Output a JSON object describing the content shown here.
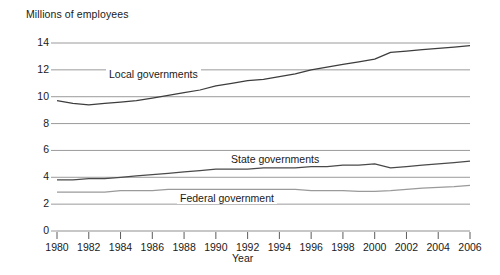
{
  "chart_data": {
    "type": "line",
    "title": "",
    "ylabel": "Millions of employees",
    "xlabel": "Year",
    "xlim": [
      1980,
      2006
    ],
    "ylim": [
      0,
      14
    ],
    "yticks": [
      0,
      2,
      4,
      6,
      8,
      10,
      12,
      14
    ],
    "xticks": [
      1980,
      1982,
      1984,
      1986,
      1988,
      1990,
      1992,
      1994,
      1996,
      1998,
      2000,
      2002,
      2004,
      2006
    ],
    "grid": true,
    "legend_position": "inline-labels",
    "x": [
      1980,
      1981,
      1982,
      1983,
      1984,
      1985,
      1986,
      1987,
      1988,
      1989,
      1990,
      1991,
      1992,
      1993,
      1994,
      1995,
      1996,
      1997,
      1998,
      1999,
      2000,
      2001,
      2002,
      2003,
      2004,
      2005,
      2006
    ],
    "series": [
      {
        "name": "Local governments",
        "color": "#3d3d3d",
        "values": [
          9.7,
          9.5,
          9.4,
          9.5,
          9.6,
          9.7,
          9.9,
          10.1,
          10.3,
          10.5,
          10.8,
          11.0,
          11.2,
          11.3,
          11.5,
          11.7,
          12.0,
          12.2,
          12.4,
          12.6,
          12.8,
          13.3,
          13.4,
          13.5,
          13.6,
          13.7,
          13.8
        ]
      },
      {
        "name": "State governments",
        "color": "#4a4a4a",
        "values": [
          3.8,
          3.8,
          3.9,
          3.9,
          4.0,
          4.1,
          4.2,
          4.3,
          4.4,
          4.5,
          4.6,
          4.6,
          4.6,
          4.7,
          4.7,
          4.7,
          4.8,
          4.8,
          4.9,
          4.9,
          5.0,
          4.7,
          4.8,
          4.9,
          5.0,
          5.1,
          5.2
        ]
      },
      {
        "name": "Federal government",
        "color": "#9a9a9a",
        "values": [
          2.9,
          2.9,
          2.9,
          2.9,
          3.0,
          3.0,
          3.0,
          3.1,
          3.1,
          3.1,
          3.1,
          3.1,
          3.1,
          3.1,
          3.1,
          3.1,
          3.0,
          3.0,
          3.0,
          2.95,
          2.95,
          3.0,
          3.1,
          3.2,
          3.25,
          3.3,
          3.4
        ]
      }
    ],
    "series_label_positions": [
      {
        "name": "Local governments",
        "x": 106,
        "y": 68
      },
      {
        "name": "State governments",
        "x": 228,
        "y": 153
      },
      {
        "name": "Federal government",
        "x": 177,
        "y": 192
      }
    ]
  },
  "axis": {
    "y_title": "Millions of employees",
    "x_title": "Year",
    "y_tick_labels": [
      "14",
      "12",
      "10",
      "8",
      "6",
      "4",
      "2",
      "0"
    ],
    "x_tick_labels": [
      "1980",
      "1982",
      "1984",
      "1986",
      "1988",
      "1990",
      "1992",
      "1994",
      "1996",
      "1998",
      "2000",
      "2002",
      "2004",
      "2006"
    ]
  },
  "style": {
    "grid_color": "#8f8f8f",
    "axis_color": "#4a4a4a",
    "background": "#ffffff"
  }
}
